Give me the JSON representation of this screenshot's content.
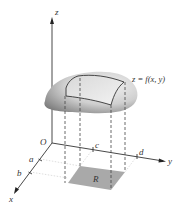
{
  "figure": {
    "surface_label": "z = f(x, y)",
    "region_label": "R",
    "axes": {
      "x": "x",
      "y": "y",
      "z": "z",
      "origin": "O"
    },
    "ticks": {
      "a": "a",
      "b": "b",
      "c": "c",
      "d": "d"
    },
    "colors": {
      "axis": "#333333",
      "surface_light": "#f2f2f2",
      "surface_dark": "#8a8a8a",
      "region_fill": "#a9a9a9",
      "dashed": "#444444"
    }
  }
}
